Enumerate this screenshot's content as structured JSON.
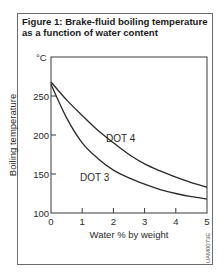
{
  "figure": {
    "title_line1": "Figure 1: Brake-fluid boiling temperature",
    "title_line2": "as a function of water content",
    "code": "UAM0073E"
  },
  "chart_data": {
    "type": "line",
    "title": "Figure 1: Brake-fluid boiling temperature as a function of water content",
    "xlabel": "Water % by weight",
    "ylabel": "Boiling temperature",
    "yunit": "°C",
    "xlim": [
      0,
      5
    ],
    "ylim": [
      100,
      300
    ],
    "xticks": [
      0,
      1,
      2,
      3,
      4,
      5
    ],
    "yticks": [
      100,
      150,
      200,
      250
    ],
    "grid": false,
    "legend": "inline labels",
    "x": [
      0,
      0.5,
      1,
      1.5,
      2,
      2.5,
      3,
      3.5,
      4,
      4.5,
      5
    ],
    "series": [
      {
        "name": "DOT 4",
        "values": [
          268,
          245,
          225,
          206,
          190,
          175,
          163,
          154,
          146,
          139,
          133
        ]
      },
      {
        "name": "DOT 3",
        "values": [
          265,
          222,
          190,
          170,
          155,
          145,
          137,
          130,
          125,
          121,
          118
        ]
      }
    ],
    "annotations": [
      "DOT 4",
      "DOT 3"
    ]
  }
}
